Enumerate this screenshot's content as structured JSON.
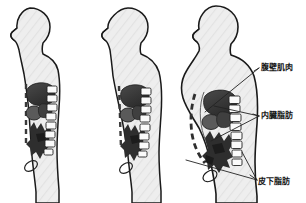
{
  "diagram": {
    "background_color": "#ffffff",
    "outline_color": "#1a1a1a",
    "body_fill_color": "#eeeeee",
    "organ_dark_color": "#3a3a3a",
    "organ_mid_color": "#6e6e6e",
    "bone_fill_color": "#f7f7f7",
    "leader_line_color": "#222222",
    "label_text_color": "#161616"
  },
  "figures": [
    {
      "id": "figure-slim",
      "position": "left",
      "description": "slim male body profile facing left",
      "body_type": "slim"
    },
    {
      "id": "figure-moderate",
      "position": "center",
      "description": "moderately overweight male body profile facing left",
      "body_type": "moderate"
    },
    {
      "id": "figure-obese",
      "position": "right",
      "description": "obese male body profile facing left with protruding abdomen",
      "body_type": "obese"
    }
  ],
  "callouts": [
    {
      "id": "abdominal-wall",
      "label": "腹壁肌肉",
      "target": "abdominal wall muscle layer"
    },
    {
      "id": "visceral-fat",
      "label": "内臓脂肪",
      "target": "visceral fat around internal organs"
    },
    {
      "id": "subcutaneous-fat",
      "label": "皮下脂肪",
      "target": "subcutaneous fat beneath skin"
    }
  ]
}
